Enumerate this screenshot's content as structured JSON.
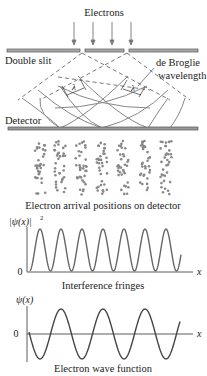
{
  "top": {
    "electrons_label": "Electrons",
    "double_slit_label": "Double slit",
    "de_broglie_line1": "de Broglie",
    "de_broglie_line2": "wavelength",
    "lambda_symbol": "λ",
    "detector_label": "Detector"
  },
  "dots": {
    "caption": "Electron arrival positions on detector",
    "columns_x": [
      40,
      60,
      81,
      102,
      123,
      145,
      166
    ]
  },
  "fringes": {
    "ylabel": "|ψ(x)|",
    "ylabel_sup": "2",
    "zero_label": "0",
    "xlabel": "x",
    "caption": "Interference fringes"
  },
  "wave": {
    "ylabel": "ψ(x)",
    "zero_label": "0",
    "xlabel": "x",
    "caption": "Electron wave function"
  },
  "colors": {
    "line": "#555555",
    "dot": "#888888",
    "text": "#222222",
    "slit_fill": "#999999"
  }
}
